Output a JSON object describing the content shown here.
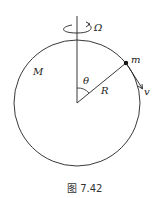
{
  "diagram": {
    "labels": {
      "omega": "Ω",
      "mass_big": "M",
      "mass_small": "m",
      "angle": "θ",
      "radius": "R",
      "velocity": "v"
    },
    "caption": "图 7.42",
    "colors": {
      "stroke": "#222222",
      "background": "#ffffff"
    }
  }
}
